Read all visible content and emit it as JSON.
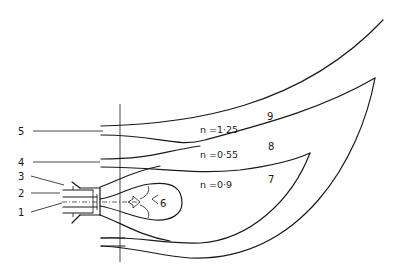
{
  "diagram": {
    "type": "burner flame / jet flow pattern schematic",
    "labels": {
      "l1": "1",
      "l2": "2",
      "l3": "3",
      "l4": "4",
      "l5": "5",
      "l6": "6",
      "l7": "7",
      "l8": "8",
      "l9": "9"
    },
    "regions": [
      {
        "id": "9",
        "n_label": "n =1·25"
      },
      {
        "id": "8",
        "n_label": "n =0·55"
      },
      {
        "id": "7",
        "n_label": "n =0·9"
      }
    ],
    "stroke_color": "#1a1a1a",
    "background": "#ffffff"
  }
}
